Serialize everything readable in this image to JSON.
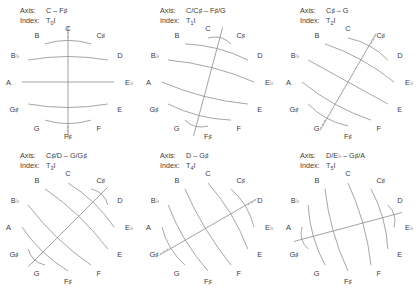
{
  "labels": {
    "axis": "Axis:",
    "index": "Index:"
  },
  "pitch_classes": [
    "C",
    "C♯",
    "D",
    "E♭",
    "E",
    "F",
    "F♯",
    "G",
    "G♯",
    "A",
    "B♭",
    "B"
  ],
  "panels": [
    {
      "id": "panel-t0i",
      "axis": "C – F♯",
      "index_base": "T",
      "index_sub": "0",
      "index_suffix": "I",
      "rotation_deg": 0,
      "axis_pitches": [
        "C",
        "F♯"
      ],
      "pairs": [
        [
          "C♯",
          "B"
        ],
        [
          "D",
          "B♭"
        ],
        [
          "E♭",
          "A"
        ],
        [
          "E",
          "G♯"
        ],
        [
          "F",
          "G"
        ]
      ]
    },
    {
      "id": "panel-t1i",
      "axis": "C/C♯ – F♯/G",
      "index_base": "T",
      "index_sub": "1",
      "index_suffix": "I",
      "rotation_deg": 15,
      "axis_pitches": [],
      "pairs": [
        [
          "C♯",
          "C"
        ],
        [
          "D",
          "B"
        ],
        [
          "E♭",
          "B♭"
        ],
        [
          "E",
          "A"
        ],
        [
          "F",
          "G♯"
        ],
        [
          "F♯",
          "G"
        ]
      ]
    },
    {
      "id": "panel-t2i",
      "axis": "C♯ – G",
      "index_base": "T",
      "index_sub": "2",
      "index_suffix": "I",
      "rotation_deg": 30,
      "axis_pitches": [
        "C♯",
        "G"
      ],
      "pairs": [
        [
          "D",
          "C"
        ],
        [
          "E♭",
          "B"
        ],
        [
          "E",
          "B♭"
        ],
        [
          "F",
          "A"
        ],
        [
          "F♯",
          "G♯"
        ]
      ]
    },
    {
      "id": "panel-t3i",
      "axis": "C♯/D – G/G♯",
      "index_base": "T",
      "index_sub": "3",
      "index_suffix": "I",
      "rotation_deg": 45,
      "axis_pitches": [],
      "pairs": [
        [
          "D",
          "C♯"
        ],
        [
          "E♭",
          "C"
        ],
        [
          "E",
          "B"
        ],
        [
          "F",
          "B♭"
        ],
        [
          "F♯",
          "A"
        ],
        [
          "G",
          "G♯"
        ]
      ]
    },
    {
      "id": "panel-t4i",
      "axis": "D – G♯",
      "index_base": "T",
      "index_sub": "4",
      "index_suffix": "I",
      "rotation_deg": 60,
      "axis_pitches": [
        "D",
        "G♯"
      ],
      "pairs": [
        [
          "E♭",
          "C♯"
        ],
        [
          "E",
          "C"
        ],
        [
          "F",
          "B"
        ],
        [
          "F♯",
          "B♭"
        ],
        [
          "G",
          "A"
        ]
      ]
    },
    {
      "id": "panel-t5i",
      "axis": "D/E♭ – G♯/A",
      "index_base": "T",
      "index_sub": "5",
      "index_suffix": "I",
      "rotation_deg": 75,
      "axis_pitches": [],
      "pairs": [
        [
          "E♭",
          "D"
        ],
        [
          "E",
          "C♯"
        ],
        [
          "F",
          "C"
        ],
        [
          "F♯",
          "B"
        ],
        [
          "G",
          "B♭"
        ],
        [
          "G♯",
          "A"
        ]
      ]
    }
  ],
  "colors": {
    "stroke": "#8f8f8f",
    "axis_stroke": "#8a8a8a",
    "text": "#3c3c3c"
  }
}
